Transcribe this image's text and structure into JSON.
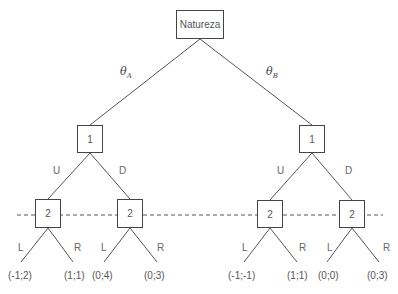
{
  "root": {
    "label": "Natureza"
  },
  "nature_branches": [
    {
      "symbol": "θ",
      "subscript": "A"
    },
    {
      "symbol": "θ",
      "subscript": "B"
    }
  ],
  "player1_nodes": [
    {
      "label": "1",
      "actions": [
        "U",
        "D"
      ]
    },
    {
      "label": "1",
      "actions": [
        "U",
        "D"
      ]
    }
  ],
  "player2_nodes": [
    {
      "label": "2",
      "actions": [
        "L",
        "R"
      ],
      "payoffs": [
        "(-1;2)",
        "(1;1)"
      ]
    },
    {
      "label": "2",
      "actions": [
        "L",
        "R"
      ],
      "payoffs": [
        "(0;4)",
        "(0;3)"
      ]
    },
    {
      "label": "2",
      "actions": [
        "L",
        "R"
      ],
      "payoffs": [
        "(-1;-1)",
        "(1;1)"
      ]
    },
    {
      "label": "2",
      "actions": [
        "L",
        "R"
      ],
      "payoffs": [
        "(0;0)",
        "(0;3)"
      ]
    }
  ],
  "information_set": {
    "player": "2",
    "style": "dashed"
  },
  "colors": {
    "line": "#555555",
    "text": "#555555",
    "background": "#ffffff"
  }
}
